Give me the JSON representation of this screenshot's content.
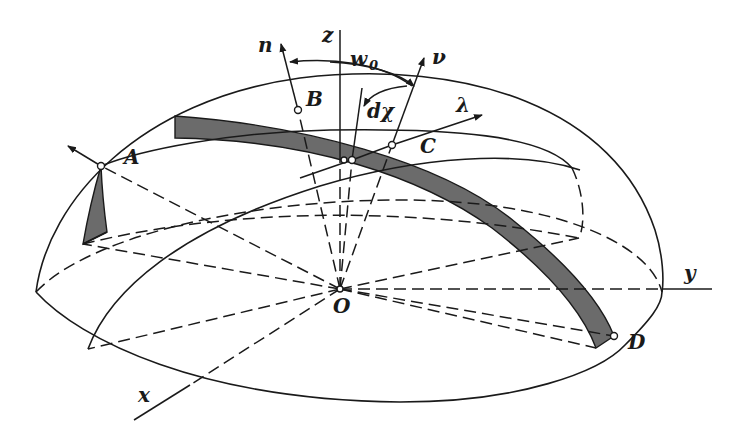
{
  "figure": {
    "colors": {
      "line": "#1a1a1a",
      "band": "#6b6b6b",
      "background": "#ffffff"
    }
  },
  "labels": {
    "z": "z",
    "n": "n",
    "w": "w",
    "w_sub": "0",
    "nu": "ν",
    "lambda": "λ",
    "dchi": "dχ",
    "A": "A",
    "B": "B",
    "C": "C",
    "D": "D",
    "O": "O",
    "x": "x",
    "y": "y"
  }
}
